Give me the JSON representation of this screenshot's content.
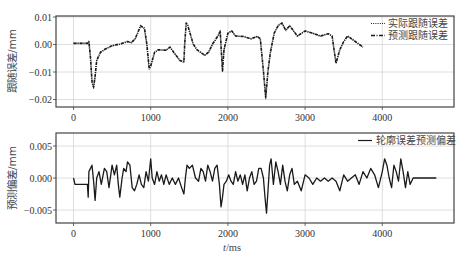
{
  "chart_data": [
    {
      "type": "line",
      "ylabel": "跟随误差/mm",
      "xlabel": "",
      "xlim": [
        -250,
        5100
      ],
      "ylim": [
        -0.023,
        0.0105
      ],
      "xticks": [
        0,
        1000,
        2000,
        3000,
        4000
      ],
      "xtick_labels": [
        "0",
        "1000",
        "2000",
        "3000",
        "4000"
      ],
      "yticks": [
        0.01,
        0.0,
        -0.01,
        -0.02
      ],
      "ytick_labels": [
        "0.01",
        "0.00",
        "-0.01",
        "-0.02"
      ],
      "grid": true,
      "legend_position": "upper right",
      "series": [
        {
          "name": "实际跟随误差",
          "style": "dotted",
          "x": [
            0,
            100,
            180,
            200,
            220,
            240,
            260,
            280,
            300,
            350,
            400,
            500,
            600,
            700,
            750,
            800,
            870,
            920,
            950,
            980,
            1000,
            1050,
            1100,
            1200,
            1250,
            1300,
            1380,
            1430,
            1440,
            1460,
            1480,
            1550,
            1600,
            1700,
            1750,
            1800,
            1870,
            1900,
            1920,
            1930,
            1950,
            2000,
            2050,
            2100,
            2200,
            2300,
            2380,
            2420,
            2460,
            2490,
            2520,
            2550,
            2600,
            2650,
            2700,
            2750,
            2800,
            2900,
            3000,
            3100,
            3200,
            3300,
            3350,
            3400,
            3450,
            3500,
            3550,
            3600,
            3650,
            3750
          ],
          "y": [
            0.0005,
            0.0005,
            0.0005,
            0.0012,
            -0.005,
            -0.014,
            -0.016,
            -0.012,
            -0.006,
            -0.003,
            -0.002,
            -0.0005,
            0.0,
            0.001,
            0.0005,
            0.002,
            0.007,
            0.006,
            0.0,
            -0.009,
            -0.008,
            -0.003,
            -0.002,
            -0.002,
            -0.001,
            -0.003,
            -0.006,
            -0.0065,
            0.0,
            0.008,
            0.007,
            0.0,
            -0.002,
            -0.004,
            -0.003,
            0.0,
            0.003,
            0.005,
            -0.005,
            -0.01,
            -0.002,
            0.004,
            0.005,
            0.003,
            0.003,
            0.002,
            0.003,
            0.002,
            -0.01,
            -0.02,
            -0.01,
            -0.003,
            0.004,
            0.007,
            0.008,
            0.005,
            0.007,
            0.003,
            0.005,
            0.004,
            0.003,
            0.004,
            0.003,
            -0.007,
            -0.002,
            0.001,
            0.003,
            0.002,
            0.001,
            -0.001
          ]
        },
        {
          "name": "预测跟随误差",
          "style": "dash-dot",
          "x": [
            0,
            100,
            180,
            200,
            220,
            240,
            260,
            280,
            300,
            350,
            400,
            500,
            600,
            700,
            750,
            800,
            870,
            920,
            950,
            980,
            1000,
            1050,
            1100,
            1200,
            1250,
            1300,
            1380,
            1430,
            1440,
            1460,
            1480,
            1550,
            1600,
            1700,
            1750,
            1800,
            1870,
            1900,
            1920,
            1930,
            1950,
            2000,
            2050,
            2100,
            2200,
            2300,
            2380,
            2420,
            2460,
            2490,
            2520,
            2550,
            2600,
            2650,
            2700,
            2750,
            2800,
            2900,
            3000,
            3100,
            3200,
            3300,
            3350,
            3400,
            3450,
            3500,
            3550,
            3600,
            3650,
            3750
          ],
          "y": [
            0.0004,
            0.0004,
            0.0004,
            0.001,
            -0.0048,
            -0.0135,
            -0.0155,
            -0.0115,
            -0.0058,
            -0.0028,
            -0.0018,
            -0.0004,
            0.0002,
            0.0011,
            0.0007,
            0.0022,
            0.0068,
            0.0058,
            0.0002,
            -0.0087,
            -0.0078,
            -0.0028,
            -0.0019,
            -0.0021,
            -0.0009,
            -0.0029,
            -0.0058,
            -0.0063,
            0.0002,
            0.0078,
            0.0069,
            0.0002,
            -0.0019,
            -0.0039,
            -0.0028,
            0.0002,
            0.0031,
            0.0048,
            -0.0048,
            -0.0095,
            -0.0018,
            0.0041,
            0.0049,
            0.0031,
            0.0029,
            0.0021,
            0.0029,
            0.0021,
            -0.0095,
            -0.0192,
            -0.0095,
            -0.0028,
            0.0041,
            0.0068,
            0.0078,
            0.0052,
            0.0068,
            0.0031,
            0.0049,
            0.0041,
            0.0031,
            0.0039,
            0.0031,
            -0.0068,
            -0.0019,
            0.0011,
            0.0031,
            0.0021,
            0.0011,
            -0.0009
          ]
        }
      ]
    },
    {
      "type": "line",
      "ylabel": "预测偏差/mm",
      "xlabel": "t/ms",
      "xlim": [
        -250,
        5100
      ],
      "ylim": [
        -0.0068,
        0.007
      ],
      "xticks": [
        0,
        1000,
        2000,
        3000,
        4000
      ],
      "xtick_labels": [
        "0",
        "1000",
        "2000",
        "3000",
        "4000"
      ],
      "yticks": [
        0.005,
        0.0,
        -0.005
      ],
      "ytick_labels": [
        "0.005",
        "0.000",
        "-0.005"
      ],
      "grid": true,
      "legend_position": "upper right",
      "series": [
        {
          "name": "轮廓误差预测偏差",
          "style": "solid",
          "x": [
            0,
            20,
            60,
            100,
            140,
            180,
            190,
            200,
            220,
            240,
            260,
            280,
            300,
            330,
            360,
            400,
            430,
            460,
            500,
            530,
            560,
            580,
            600,
            630,
            650,
            680,
            700,
            730,
            760,
            790,
            820,
            850,
            880,
            910,
            940,
            970,
            1000,
            1020,
            1050,
            1080,
            1110,
            1140,
            1170,
            1200,
            1240,
            1280,
            1320,
            1360,
            1400,
            1430,
            1450,
            1470,
            1500,
            1540,
            1580,
            1620,
            1650,
            1680,
            1710,
            1740,
            1770,
            1800,
            1830,
            1860,
            1890,
            1910,
            1930,
            1950,
            1980,
            2010,
            2040,
            2070,
            2100,
            2130,
            2160,
            2190,
            2220,
            2250,
            2280,
            2310,
            2340,
            2370,
            2400,
            2430,
            2460,
            2480,
            2500,
            2520,
            2540,
            2560,
            2590,
            2620,
            2650,
            2680,
            2710,
            2740,
            2770,
            2800,
            2830,
            2860,
            2900,
            2950,
            3000,
            3050,
            3100,
            3150,
            3200,
            3250,
            3300,
            3350,
            3400,
            3450,
            3500,
            3550,
            3600,
            3650,
            3700,
            3750,
            3800,
            3850,
            3900,
            3950,
            4000,
            4030,
            4060,
            4090,
            4120,
            4150,
            4180,
            4210,
            4240,
            4270,
            4300,
            4330,
            4360,
            4400,
            4700
          ],
          "y": [
            0.0,
            -0.001,
            -0.001,
            -0.001,
            -0.001,
            -0.001,
            -0.003,
            0.001,
            0.0015,
            0.002,
            -0.0005,
            -0.0035,
            0.0,
            0.001,
            -0.001,
            0.0015,
            0.001,
            -0.0015,
            0.002,
            0.0005,
            0.002,
            -0.001,
            -0.003,
            0.0,
            0.0015,
            0.001,
            0.0025,
            0.002,
            -0.0015,
            -0.002,
            -0.001,
            0.0005,
            -0.001,
            -0.0015,
            0.001,
            -0.0005,
            0.003,
            0.0,
            -0.001,
            0.001,
            -0.0005,
            0.0005,
            -0.001,
            0.0005,
            -0.001,
            0.0,
            -0.001,
            0.0,
            -0.0015,
            -0.0025,
            0.0,
            0.002,
            0.0015,
            0.002,
            0.0,
            -0.0005,
            0.0015,
            0.001,
            -0.0005,
            0.002,
            0.001,
            -0.0005,
            0.0015,
            0.002,
            -0.001,
            -0.0045,
            -0.003,
            -0.001,
            -0.0005,
            0.0005,
            -0.0005,
            -0.001,
            0.001,
            -0.0005,
            0.0005,
            -0.001,
            0.0005,
            -0.002,
            0.0,
            0.001,
            -0.001,
            -0.0005,
            0.0015,
            0.0015,
            0.0,
            -0.003,
            -0.0055,
            -0.002,
            0.002,
            0.003,
            -0.001,
            0.0025,
            0.001,
            -0.001,
            0.002,
            -0.0005,
            -0.002,
            0.0005,
            0.0015,
            -0.001,
            -0.0005,
            -0.002,
            0.0005,
            0.0,
            -0.001,
            0.0,
            -0.0005,
            0.0,
            -0.0005,
            0.0,
            -0.0005,
            -0.002,
            0.0005,
            -0.0005,
            0.0,
            0.0005,
            -0.001,
            0.001,
            0.0,
            0.0015,
            0.0005,
            -0.0015,
            0.001,
            0.003,
            0.002,
            0.0,
            -0.0015,
            0.002,
            0.001,
            -0.0005,
            0.003,
            0.001,
            -0.0015,
            0.001,
            -0.001,
            0.0,
            0.0,
            0.0
          ]
        }
      ]
    }
  ],
  "legend": {
    "top": [
      "实际跟随误差",
      "预测跟随误差"
    ],
    "bottom": [
      "轮廓误差预测偏差"
    ]
  },
  "colors": {
    "line": "#1a1a1a",
    "grid": "#d6d6d6",
    "frame": "#444444"
  }
}
